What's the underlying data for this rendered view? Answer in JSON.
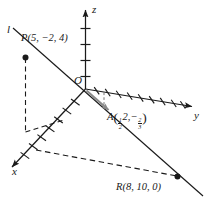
{
  "figure": {
    "background_color": "#ffffff",
    "stroke_color": "#1a1a1a",
    "vector_color": "#808080",
    "axes": [
      {
        "name": "x",
        "label": "x",
        "tick_count": 7
      },
      {
        "name": "y",
        "label": "y",
        "tick_count": 9
      },
      {
        "name": "z",
        "label": "z",
        "tick_count": 4
      }
    ],
    "origin_label": "O",
    "line_label": "l",
    "points": [
      {
        "name": "P",
        "label_text": "P(5, −2, 4)",
        "letter": "P",
        "coords_text": "(5, −2, 4)",
        "x": 5,
        "y": -2,
        "z": 4,
        "marker": "filled-dot"
      },
      {
        "name": "R",
        "label_text": "R(8, 10, 0)",
        "letter": "R",
        "coords_text": "(8, 10, 0)",
        "x": 8,
        "y": 10,
        "z": 0,
        "marker": "filled-dot"
      },
      {
        "name": "A",
        "letter": "A",
        "x_num": "1",
        "x_den": "2",
        "y_val": "2,",
        "minus": "−",
        "z_num": "2",
        "z_den": "3",
        "marker": "vector-arrowhead"
      }
    ]
  }
}
